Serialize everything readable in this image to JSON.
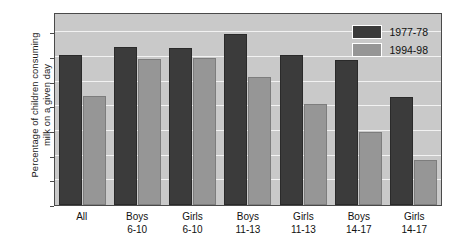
{
  "chart_data": {
    "type": "bar",
    "title": "",
    "xlabel": "",
    "ylabel": "Percentage of children consuming milk on a given day",
    "ylabel_lines": [
      "Percentage of children consuming",
      "milk on a given day"
    ],
    "categories": [
      "All",
      "Boys 6-10",
      "Girls 6-10",
      "Boys 11-13",
      "Girls 11-13",
      "Boys 14-17",
      "Girls 14-17"
    ],
    "category_lines": [
      {
        "l1": "All",
        "l2": ""
      },
      {
        "l1": "Boys",
        "l2": "6-10"
      },
      {
        "l1": "Girls",
        "l2": "6-10"
      },
      {
        "l1": "Boys",
        "l2": "11-13"
      },
      {
        "l1": "Girls",
        "l2": "11-13"
      },
      {
        "l1": "Boys",
        "l2": "14-17"
      },
      {
        "l1": "Girls",
        "l2": "14-17"
      }
    ],
    "series": [
      {
        "name": "1977-78",
        "color": "#3b3b3b",
        "values": [
          30.4,
          32.0,
          31.9,
          34.7,
          30.4,
          29.4,
          21.8
        ]
      },
      {
        "name": "1994-98",
        "color": "#969696",
        "values": [
          22.0,
          29.5,
          29.8,
          26.0,
          20.4,
          14.7,
          9.2
        ]
      }
    ],
    "ylim": [
      0,
      39.1
    ],
    "yticks": [
      0,
      5,
      10,
      15,
      20,
      25,
      30,
      35
    ],
    "ytick_labels": [
      "0",
      "5",
      "10",
      "15",
      "20",
      "25",
      "30",
      "35"
    ],
    "grid": true,
    "grid_color": "#f2f2f2",
    "legend_position": "top-right",
    "plot_background": "#c9c9c9",
    "figure_background": "#ffffff"
  }
}
